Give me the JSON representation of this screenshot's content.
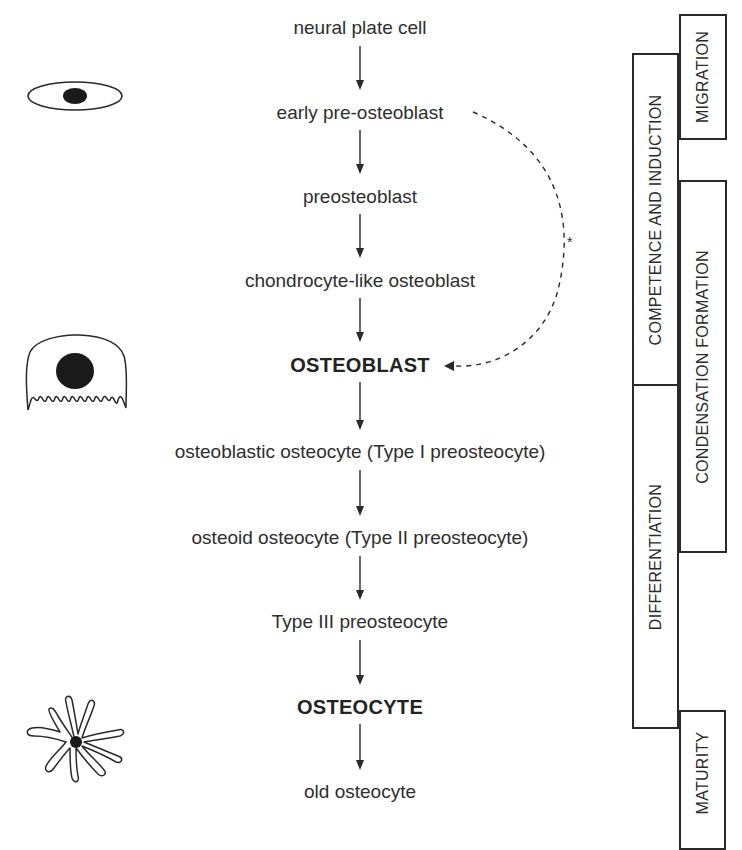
{
  "diagram": {
    "stages": [
      {
        "label": "neural plate cell",
        "bold": false,
        "y": 28
      },
      {
        "label": "early pre-osteoblast",
        "bold": false,
        "y": 113
      },
      {
        "label": "preosteoblast",
        "bold": false,
        "y": 197
      },
      {
        "label": "chondrocyte-like osteoblast",
        "bold": false,
        "y": 281
      },
      {
        "label": "OSTEOBLAST",
        "bold": true,
        "y": 365
      },
      {
        "label": "osteoblastic osteocyte (Type I preosteocyte)",
        "bold": false,
        "y": 452
      },
      {
        "label": "osteoid osteocyte (Type II preosteocyte)",
        "bold": false,
        "y": 538
      },
      {
        "label": "Type III preosteocyte",
        "bold": false,
        "y": 622
      },
      {
        "label": "OSTEOCYTE",
        "bold": true,
        "y": 707
      },
      {
        "label": "old osteocyte",
        "bold": false,
        "y": 792
      }
    ],
    "shortcut": {
      "from": "early pre-osteoblast",
      "to": "OSTEOBLAST",
      "style": "dashed",
      "annotation": "*"
    },
    "phases": [
      {
        "label": "MIGRATION",
        "column": "right",
        "top": 14,
        "bottom": 140
      },
      {
        "label": "COMPETENCE AND INDUCTION",
        "column": "left",
        "top": 53,
        "bottom": 385
      },
      {
        "label": "CONDENSATION FORMATION",
        "column": "right",
        "top": 180,
        "bottom": 552
      },
      {
        "label": "DIFFERENTIATION",
        "column": "left",
        "top": 385,
        "bottom": 728
      },
      {
        "label": "MATURITY",
        "column": "right",
        "top": 710,
        "bottom": 840
      }
    ],
    "cell_icons": [
      {
        "name": "spindle-cell-icon",
        "represents": "early pre-osteoblast"
      },
      {
        "name": "osteoblast-cell-icon",
        "represents": "OSTEOBLAST"
      },
      {
        "name": "osteocyte-cell-icon",
        "represents": "OSTEOCYTE"
      }
    ],
    "colors": {
      "line": "#2a2a2a",
      "text": "#2e2e2e",
      "background": "#ffffff"
    }
  }
}
